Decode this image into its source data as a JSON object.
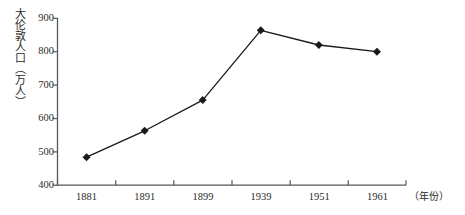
{
  "chart_data": {
    "type": "line",
    "title": "",
    "subtitle": "",
    "ylabel": "大伦敦人口（万人）",
    "xlabel": "（年份）",
    "categories": [
      "1881",
      "1891",
      "1899",
      "1939",
      "1951",
      "1961"
    ],
    "values": [
      484,
      563,
      655,
      864,
      820,
      800
    ],
    "series": [
      {
        "name": "大伦敦人口",
        "values": [
          484,
          563,
          655,
          864,
          820,
          800
        ]
      }
    ],
    "ylim": [
      400,
      900
    ],
    "yticks": [
      "400",
      "500",
      "600",
      "700",
      "800",
      "900"
    ],
    "ytick_values": [
      400,
      500,
      600,
      700,
      800,
      900
    ],
    "xticks": [
      "1881",
      "1891",
      "1899",
      "1939",
      "1951",
      "1961"
    ],
    "grid": false,
    "legend": false,
    "legend_position": "none",
    "marker": "diamond",
    "line_color": "#1a1a1a",
    "marker_color": "#1a1a1a",
    "axis_color": "#55565a",
    "background_color": "#ffffff"
  },
  "axes": {
    "y_title": "大伦敦人口（万人）",
    "x_unit": "（年份）"
  }
}
